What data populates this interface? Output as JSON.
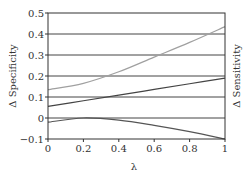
{
  "chart_data": {
    "type": "line",
    "title": "",
    "xlabel": "λ",
    "ylabel_left": "Δ Specificity",
    "ylabel_right": "Δ Sensitivity",
    "xlim": [
      0,
      1
    ],
    "ylim": [
      -0.1,
      0.5
    ],
    "x_ticks": [
      "0",
      "0.2",
      "0.4",
      "0.6",
      "0.8",
      "1"
    ],
    "y_ticks": [
      "−0.1",
      "0",
      "0.1",
      "0.2",
      "0.3",
      "0.4",
      "0.5"
    ],
    "grid": "horizontal lines at 0, 0.1, 0.2, 0.3, 0.4, 0.5",
    "legend": "none",
    "x": [
      0,
      0.2,
      0.4,
      0.6,
      0.8,
      1.0
    ],
    "series": [
      {
        "name": "light-gray-curve",
        "color": "#a0a0a0",
        "values": [
          0.135,
          0.165,
          0.22,
          0.29,
          0.36,
          0.435
        ]
      },
      {
        "name": "dark-line",
        "color": "#444444",
        "values": [
          0.055,
          0.082,
          0.109,
          0.136,
          0.163,
          0.19
        ]
      },
      {
        "name": "lower-curve",
        "color": "#555555",
        "values": [
          -0.02,
          0.0,
          -0.01,
          -0.035,
          -0.065,
          -0.1
        ]
      }
    ]
  },
  "colors": {
    "axis": "#333333",
    "grid": "#444444"
  }
}
